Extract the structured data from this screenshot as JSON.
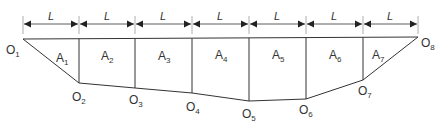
{
  "diagram": {
    "colors": {
      "line": "#333333",
      "background": "#ffffff"
    },
    "spacing_label": "L",
    "dimension_labels": [
      "L",
      "L",
      "L",
      "L",
      "L",
      "L",
      "L"
    ],
    "points": [
      {
        "name": "O",
        "sub": "1"
      },
      {
        "name": "O",
        "sub": "2"
      },
      {
        "name": "O",
        "sub": "3"
      },
      {
        "name": "O",
        "sub": "4"
      },
      {
        "name": "O",
        "sub": "5"
      },
      {
        "name": "O",
        "sub": "6"
      },
      {
        "name": "O",
        "sub": "7"
      },
      {
        "name": "O",
        "sub": "8"
      }
    ],
    "areas": [
      {
        "name": "A",
        "sub": "1"
      },
      {
        "name": "A",
        "sub": "2"
      },
      {
        "name": "A",
        "sub": "3"
      },
      {
        "name": "A",
        "sub": "4"
      },
      {
        "name": "A",
        "sub": "5"
      },
      {
        "name": "A",
        "sub": "6"
      },
      {
        "name": "A",
        "sub": "7"
      }
    ]
  }
}
